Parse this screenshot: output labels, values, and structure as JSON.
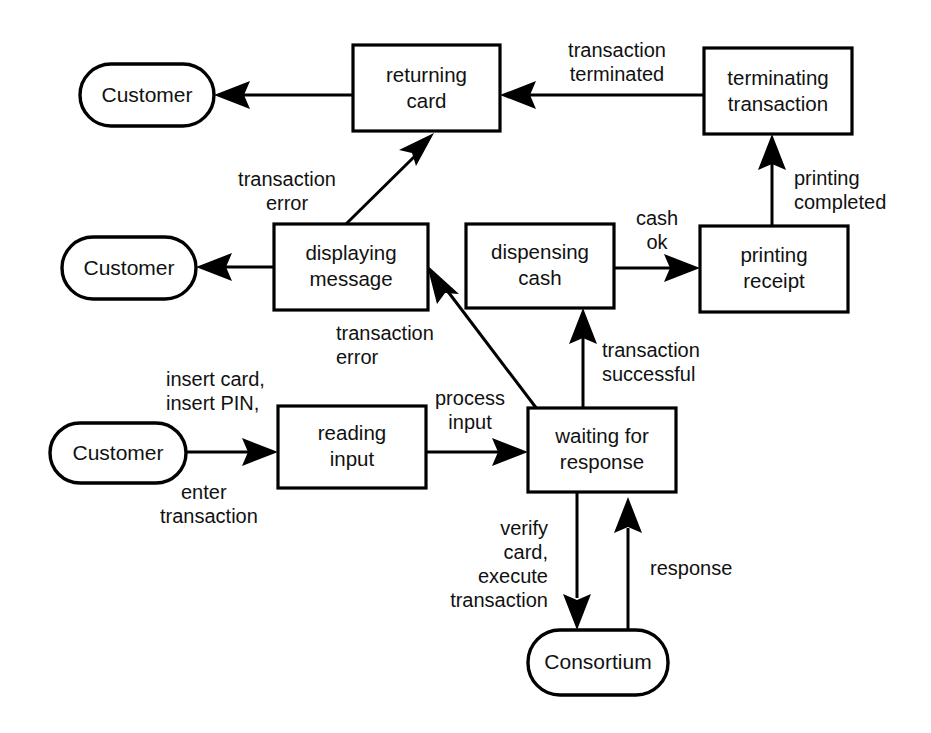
{
  "diagram": {
    "type": "state-transition-diagram",
    "background_color": "#ffffff",
    "line_color": "#000000",
    "text_color": "#111111",
    "states": [
      {
        "id": "returning_card",
        "label_line1": "returning",
        "label_line2": "card",
        "shape": "rect",
        "x": 353,
        "y": 45,
        "w": 147,
        "h": 86
      },
      {
        "id": "terminating_transaction",
        "label_line1": "terminating",
        "label_line2": "transaction",
        "shape": "rect",
        "x": 704,
        "y": 48,
        "w": 148,
        "h": 86
      },
      {
        "id": "displaying_message",
        "label_line1": "displaying",
        "label_line2": "message",
        "shape": "rect",
        "x": 274,
        "y": 224,
        "w": 154,
        "h": 86
      },
      {
        "id": "dispensing_cash",
        "label_line1": "dispensing",
        "label_line2": "cash",
        "shape": "rect",
        "x": 466,
        "y": 224,
        "w": 148,
        "h": 84
      },
      {
        "id": "printing_receipt",
        "label_line1": "printing",
        "label_line2": "receipt",
        "shape": "rect",
        "x": 700,
        "y": 226,
        "w": 148,
        "h": 86
      },
      {
        "id": "reading_input",
        "label_line1": "reading",
        "label_line2": "input",
        "shape": "rect",
        "x": 278,
        "y": 406,
        "w": 148,
        "h": 82
      },
      {
        "id": "waiting_for_response",
        "label_line1": "waiting for",
        "label_line2": "response",
        "shape": "rect",
        "x": 528,
        "y": 408,
        "w": 148,
        "h": 84
      }
    ],
    "actors": [
      {
        "id": "customer_top",
        "label": "Customer",
        "shape": "pill",
        "x": 80,
        "y": 64,
        "w": 134,
        "h": 62
      },
      {
        "id": "customer_middle",
        "label": "Customer",
        "shape": "pill",
        "x": 62,
        "y": 237,
        "w": 134,
        "h": 62
      },
      {
        "id": "customer_bottom",
        "label": "Customer",
        "shape": "pill",
        "x": 50,
        "y": 423,
        "w": 136,
        "h": 60
      },
      {
        "id": "consortium",
        "label": "Consortium",
        "shape": "pill",
        "x": 528,
        "y": 630,
        "w": 140,
        "h": 65
      }
    ],
    "transitions": [
      {
        "id": "t1",
        "from": "returning_card",
        "to": "customer_top",
        "label": "",
        "kind": "horizontal-left"
      },
      {
        "id": "t2",
        "from": "terminating_transaction",
        "to": "returning_card",
        "label_lines": [
          "transaction",
          "terminated"
        ],
        "kind": "horizontal-left"
      },
      {
        "id": "t3",
        "from": "printing_receipt",
        "to": "terminating_transaction",
        "label_lines": [
          "printing",
          "completed"
        ],
        "kind": "vertical-up"
      },
      {
        "id": "t4",
        "from": "displaying_message",
        "to": "returning_card",
        "label_lines": [
          "transaction",
          "error"
        ],
        "kind": "diagonal-up-right"
      },
      {
        "id": "t5",
        "from": "displaying_message",
        "to": "customer_middle",
        "label": "",
        "kind": "horizontal-left"
      },
      {
        "id": "t6",
        "from": "dispensing_cash",
        "to": "printing_receipt",
        "label_lines": [
          "cash",
          "ok"
        ],
        "kind": "horizontal-right"
      },
      {
        "id": "t7",
        "from": "waiting_for_response",
        "to": "displaying_message",
        "label_lines": [
          "transaction",
          "error"
        ],
        "kind": "diagonal-up-left"
      },
      {
        "id": "t8",
        "from": "customer_bottom",
        "to": "reading_input",
        "label_lines": [
          "insert card,",
          "insert PIN,",
          "enter",
          "transaction"
        ],
        "kind": "horizontal-right"
      },
      {
        "id": "t9",
        "from": "reading_input",
        "to": "waiting_for_response",
        "label_lines": [
          "process",
          "input"
        ],
        "kind": "horizontal-right"
      },
      {
        "id": "t10",
        "from": "waiting_for_response",
        "to": "dispensing_cash",
        "label_lines": [
          "transaction",
          "successful"
        ],
        "kind": "vertical-up"
      },
      {
        "id": "t11",
        "from": "waiting_for_response",
        "to": "consortium",
        "label_lines": [
          "verify",
          "card,",
          "execute",
          "transaction"
        ],
        "kind": "vertical-down"
      },
      {
        "id": "t12",
        "from": "consortium",
        "to": "waiting_for_response",
        "label_lines": [
          "response"
        ],
        "kind": "vertical-up"
      }
    ],
    "labels": {
      "transaction_terminated_1": "transaction",
      "transaction_terminated_2": "terminated",
      "printing_completed_1": "printing",
      "printing_completed_2": "completed",
      "transaction_error_top_1": "transaction",
      "transaction_error_top_2": "error",
      "cash_ok_1": "cash",
      "cash_ok_2": "ok",
      "transaction_error_mid_1": "transaction",
      "transaction_error_mid_2": "error",
      "transaction_successful_1": "transaction",
      "transaction_successful_2": "successful",
      "insert_card": "insert card,",
      "insert_pin": "insert PIN,",
      "enter": "enter",
      "enter_transaction": "transaction",
      "process_input_1": "process",
      "process_input_2": "input",
      "verify_1": "verify",
      "verify_2": "card,",
      "verify_3": "execute",
      "verify_4": "transaction",
      "response": "response"
    }
  }
}
